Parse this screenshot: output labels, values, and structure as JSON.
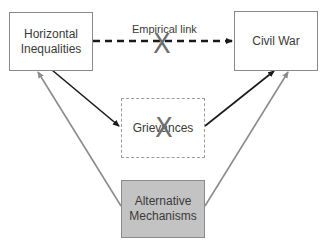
{
  "diagram": {
    "nodes": {
      "horizontal_inequalities": {
        "label_line1": "Horizontal",
        "label_line2": "Inequalities"
      },
      "civil_war": {
        "label": "Civil War"
      },
      "grievances": {
        "label": "Grievances"
      },
      "alternative_mechanisms": {
        "label_line1": "Alternative",
        "label_line2": "Mechanisms"
      }
    },
    "edges": [
      {
        "from": "horizontal_inequalities",
        "to": "civil_war",
        "style": "dashed",
        "label": "Empirical link",
        "crossed_out": true
      },
      {
        "from": "horizontal_inequalities",
        "to": "grievances",
        "style": "solid-black"
      },
      {
        "from": "grievances",
        "to": "civil_war",
        "style": "solid-black"
      },
      {
        "from": "alternative_mechanisms",
        "to": "horizontal_inequalities",
        "style": "solid-gray"
      },
      {
        "from": "alternative_mechanisms",
        "to": "civil_war",
        "style": "solid-gray"
      }
    ],
    "empirical_link_label": "Empirical link",
    "cross_mark": "X",
    "colors": {
      "black_arrow": "#1a1a1a",
      "gray_arrow": "#8c8c8c",
      "shaded_box": "#c3c3c3",
      "cross": "#6e6e6e"
    }
  }
}
